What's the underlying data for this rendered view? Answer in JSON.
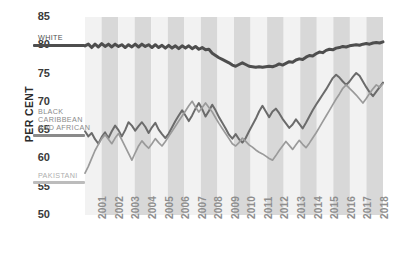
{
  "chart_data": {
    "type": "line",
    "title": "",
    "xlabel": "",
    "ylabel": "PER CENT",
    "ylim": [
      50,
      85
    ],
    "xlim": [
      2001,
      2018.75
    ],
    "yticks": [
      50,
      55,
      60,
      65,
      70,
      75,
      80,
      85
    ],
    "xticks": [
      "2001",
      "2002",
      "2003",
      "2004",
      "2005",
      "2006",
      "2007",
      "2008",
      "2009",
      "2010",
      "2011",
      "2012",
      "2013",
      "2014",
      "2015",
      "2016",
      "2017",
      "2018"
    ],
    "grid": false,
    "legend_position": "left-inline",
    "background_bands": "alternating vertical grey bands, one per year",
    "series": [
      {
        "name": "WHITE",
        "color": "#4e4e4e",
        "label_color": "#4e4e4e",
        "label_y_value": 80.4,
        "values": [
          79.9,
          80.2,
          79.6,
          80.2,
          79.7,
          80.3,
          79.8,
          80.2,
          79.7,
          80.2,
          79.8,
          80.1,
          79.6,
          80.1,
          79.7,
          80.2,
          79.7,
          80.2,
          79.8,
          80.1,
          79.6,
          80.1,
          79.6,
          80.0,
          79.5,
          80.0,
          79.5,
          79.9,
          79.4,
          79.9,
          79.5,
          79.9,
          79.4,
          79.8,
          79.3,
          79.6,
          79.2,
          79.3,
          78.6,
          78.2,
          77.8,
          77.5,
          77.2,
          76.9,
          76.5,
          76.3,
          76.6,
          76.9,
          76.6,
          76.3,
          76.2,
          76.1,
          76.2,
          76.1,
          76.2,
          76.3,
          76.2,
          76.4,
          76.7,
          76.5,
          76.8,
          77.1,
          77.0,
          77.4,
          77.6,
          77.5,
          77.9,
          78.2,
          78.1,
          78.5,
          78.8,
          78.7,
          79.1,
          79.3,
          79.2,
          79.5,
          79.6,
          79.8,
          79.7,
          79.9,
          80.0,
          80.1,
          80.0,
          80.2,
          80.3,
          80.2,
          80.4,
          80.5,
          80.4,
          80.6
        ]
      },
      {
        "name": "BLACK CARIBBEAN AND AFRICAN",
        "color": "#6b6b6b",
        "label_color": "#8a8a8a",
        "label_y_value": 65.0,
        "values": [
          64.8,
          63.9,
          64.5,
          63.4,
          62.6,
          63.8,
          64.6,
          63.6,
          64.8,
          65.8,
          65.0,
          63.9,
          65.0,
          66.4,
          65.8,
          64.9,
          65.7,
          66.4,
          65.6,
          64.5,
          65.5,
          66.3,
          65.1,
          64.3,
          63.6,
          64.4,
          65.5,
          66.6,
          67.6,
          68.5,
          67.6,
          66.6,
          67.6,
          68.8,
          69.8,
          68.7,
          67.4,
          68.4,
          69.5,
          68.5,
          67.3,
          66.3,
          65.3,
          64.2,
          63.5,
          64.3,
          63.4,
          62.8,
          63.6,
          64.8,
          65.9,
          67.0,
          68.3,
          69.3,
          68.3,
          67.3,
          68.3,
          68.8,
          68.0,
          67.0,
          66.2,
          65.4,
          66.0,
          66.9,
          66.1,
          65.3,
          66.3,
          67.4,
          68.5,
          69.5,
          70.4,
          71.3,
          72.2,
          73.2,
          74.2,
          74.8,
          74.3,
          73.6,
          73.0,
          73.6,
          74.4,
          75.1,
          74.6,
          73.6,
          72.6,
          71.7,
          71.0,
          71.8,
          72.6,
          73.4
        ]
      },
      {
        "name": "PAKISTANI",
        "color": "#9a9a9a",
        "label_color": "#a8a8a8",
        "label_y_value": 58.4,
        "values": [
          57.4,
          58.6,
          60.0,
          61.4,
          62.5,
          63.5,
          64.2,
          63.4,
          62.6,
          63.6,
          64.4,
          63.3,
          62.1,
          60.9,
          59.7,
          61.0,
          62.2,
          63.1,
          62.4,
          61.8,
          62.6,
          63.5,
          62.8,
          62.2,
          63.0,
          63.9,
          64.8,
          65.7,
          66.6,
          67.5,
          68.4,
          69.3,
          70.1,
          69.1,
          68.2,
          69.0,
          69.8,
          69.0,
          68.2,
          67.2,
          66.2,
          65.3,
          64.4,
          63.5,
          62.6,
          62.2,
          62.8,
          63.6,
          63.0,
          62.4,
          62.0,
          61.5,
          61.1,
          60.8,
          60.4,
          60.0,
          59.7,
          60.5,
          61.4,
          62.2,
          63.0,
          62.3,
          61.6,
          62.4,
          63.2,
          62.5,
          61.9,
          62.7,
          63.6,
          64.5,
          65.5,
          66.5,
          67.5,
          68.5,
          69.5,
          70.5,
          71.4,
          72.4,
          73.0,
          72.4,
          71.8,
          71.2,
          70.5,
          69.8,
          70.6,
          71.5,
          72.3,
          73.0,
          72.6,
          73.2
        ]
      }
    ]
  },
  "legend": {
    "white_label": "WHITE",
    "black_label_line1": "BLACK",
    "black_label_line2": "CARIBBEAN",
    "black_label_line3": "AND AFRICAN",
    "pakistani_label": "PAKISTANI"
  },
  "axis": {
    "y_title": "PER CENT",
    "yticks": [
      "85",
      "80",
      "75",
      "70",
      "65",
      "60",
      "55",
      "50"
    ],
    "xticks": [
      "2001",
      "2002",
      "2003",
      "2004",
      "2005",
      "2006",
      "2007",
      "2008",
      "2009",
      "2010",
      "2011",
      "2012",
      "2013",
      "2014",
      "2015",
      "2016",
      "2017",
      "2018"
    ]
  },
  "colors": {
    "band_light": "#f2f2f2",
    "band_dark": "#d8d8d8",
    "white_series": "#4e4e4e",
    "black_series": "#6b6b6b",
    "pakistani_series": "#9a9a9a",
    "tick_text": "#3a3a3a",
    "xtick_text": "#8e8e8e"
  }
}
